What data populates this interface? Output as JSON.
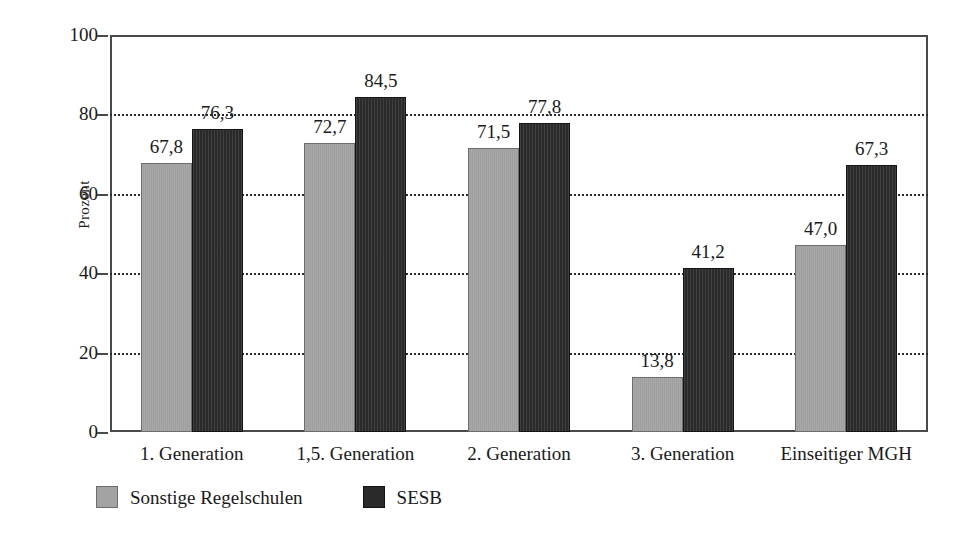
{
  "chart_data": {
    "type": "bar",
    "title": "",
    "subtitle": "",
    "xlabel": "",
    "ylabel": "Prozent",
    "ylim": [
      0,
      100
    ],
    "yticks": [
      0,
      20,
      40,
      60,
      80,
      100
    ],
    "ytick_labels": [
      "0",
      "20",
      "40",
      "60",
      "80",
      "100"
    ],
    "grid": "horizontal-dotted",
    "legend_position": "bottom-left",
    "decimal_separator": ",",
    "categories": [
      "1. Generation",
      "1,5. Generation",
      "2. Generation",
      "3. Generation",
      "Einseitiger MGH"
    ],
    "series": [
      {
        "name": "Sonstige Regelschulen",
        "color": "#a3a3a3",
        "values": [
          67.8,
          72.7,
          71.5,
          13.8,
          47.0
        ],
        "value_labels": [
          "67,8",
          "72,7",
          "71,5",
          "13,8",
          "47,0"
        ]
      },
      {
        "name": "SESB",
        "color": "#2a2a2a",
        "values": [
          76.3,
          84.5,
          77.8,
          41.2,
          67.3
        ],
        "value_labels": [
          "76,3",
          "84,5",
          "77,8",
          "41,2",
          "67,3"
        ]
      }
    ]
  },
  "legend": {
    "items": [
      {
        "label": "Sonstige Regelschulen",
        "color": "#a3a3a3"
      },
      {
        "label": "SESB",
        "color": "#2a2a2a"
      }
    ]
  },
  "axes": {
    "y_title": "Prozent",
    "y_tick_labels": [
      "100",
      "80",
      "60",
      "40",
      "20",
      "0"
    ],
    "x_tick_labels": [
      "1. Generation",
      "1,5. Generation",
      "2. Generation",
      "3. Generation",
      "Einseitiger MGH"
    ]
  },
  "colors": {
    "series_a": "#a3a3a3",
    "series_b": "#2a2a2a",
    "axis": "#4a4a4a",
    "grid": "#2b2b2b",
    "text": "#1a1a1a",
    "background": "#ffffff"
  }
}
